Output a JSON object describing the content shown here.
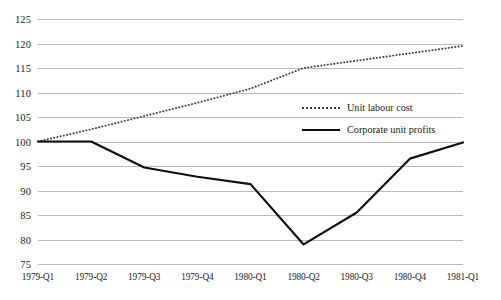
{
  "chart_data": {
    "type": "line",
    "title": "",
    "subtitle": "",
    "xlabel": "",
    "ylabel": "",
    "categories": [
      "1979-Q1",
      "1979-Q2",
      "1979-Q3",
      "1979-Q4",
      "1980-Q1",
      "1980-Q2",
      "1980-Q3",
      "1980-Q4",
      "1981-Q1"
    ],
    "ylim": [
      75,
      125
    ],
    "yticks": [
      75,
      80,
      85,
      90,
      95,
      100,
      105,
      110,
      115,
      120,
      125
    ],
    "grid": "horizontal",
    "legend_position": "center-right-inside",
    "series": [
      {
        "name": "Unit labour cost",
        "style": "dotted",
        "color": "#3a3a3a",
        "values": [
          100.0,
          102.5,
          105.2,
          107.9,
          110.8,
          115.0,
          116.5,
          118.0,
          119.5
        ]
      },
      {
        "name": "Corporate unit profits",
        "style": "solid",
        "color": "#111111",
        "values": [
          100.0,
          100.0,
          94.7,
          92.8,
          91.3,
          79.0,
          85.5,
          96.5,
          99.8
        ]
      }
    ]
  },
  "legend": {
    "items": [
      {
        "label": "Unit labour cost"
      },
      {
        "label": "Corporate unit profits"
      }
    ]
  },
  "colors": {
    "gridline": "#b9b9b9",
    "unit_labour_cost": "#3a3a3a",
    "corporate_unit_profits": "#111111",
    "background": "#ffffff",
    "text": "#1b1b1b"
  }
}
